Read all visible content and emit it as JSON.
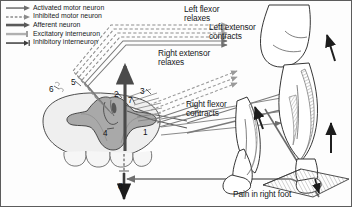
{
  "figure": {
    "background_color": "#fdfdfd",
    "border_color": "#5c5c5c",
    "ink_color": "#16181a",
    "gray_matter_color": "#a9a9a9",
    "white_matter_color": "#efefef",
    "arrow_color": "#4a4a4a"
  },
  "legend": {
    "items": [
      {
        "label": "Activated motor neuron",
        "style": "solid-arrow",
        "color": "#6d6d6d"
      },
      {
        "label": "Inhibited motor neuron",
        "style": "dashed-arrow",
        "color": "#8a8a8a"
      },
      {
        "label": "Afferent neuron",
        "style": "thick-solid-arrow",
        "color": "#5a5a5a"
      },
      {
        "label": "Excitatory interneuron",
        "style": "light-bar-arrow",
        "color": "#b0b0b0"
      },
      {
        "label": "Inhibitory interneuron",
        "style": "solid-bar-arrow",
        "color": "#3c3c3c"
      }
    ]
  },
  "annotations": {
    "left_flexor": "Left flexor\nrelaxes",
    "left_extensor": "Left extensor\ncontracts",
    "right_extensor": "Right extensor\nrelaxes",
    "right_flexor": "Right flexor\ncontracts",
    "pain": "Pain in right foot"
  },
  "pathway_numbers": [
    {
      "id": "1",
      "x": 142,
      "y": 127
    },
    {
      "id": "2",
      "x": 113,
      "y": 89
    },
    {
      "id": "3",
      "x": 139,
      "y": 86
    },
    {
      "id": "4",
      "x": 102,
      "y": 128
    },
    {
      "id": "5",
      "x": 70,
      "y": 77
    },
    {
      "id": "6",
      "x": 48,
      "y": 84
    },
    {
      "id": "7",
      "x": 127,
      "y": 95
    },
    {
      "id": "8",
      "x": 117,
      "y": 181
    }
  ]
}
